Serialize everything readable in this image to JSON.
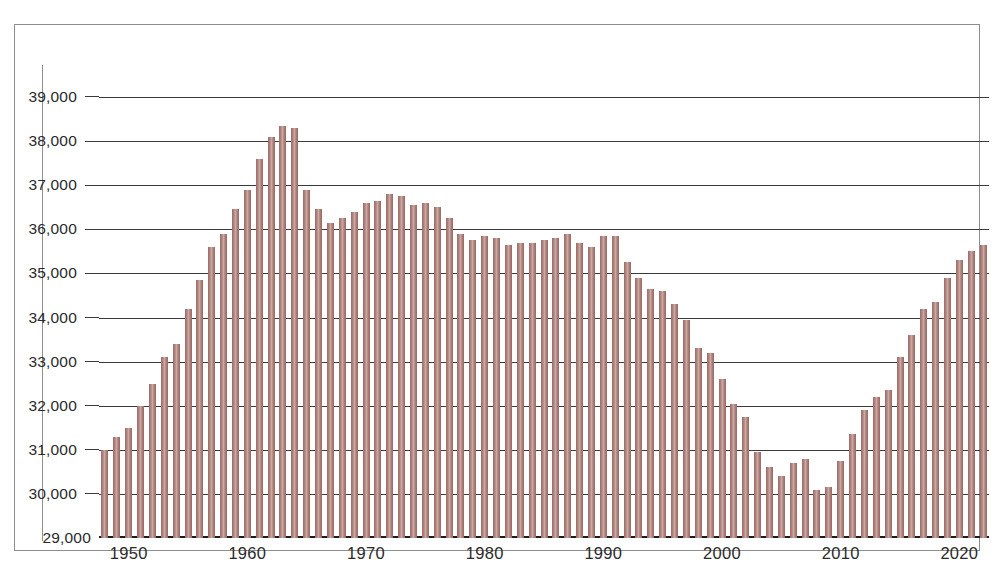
{
  "chart_data": {
    "type": "bar",
    "title": "",
    "subtitle": "",
    "xlabel": "",
    "ylabel": "",
    "ylim": [
      29000,
      39000
    ],
    "ytick_values": [
      29000,
      30000,
      31000,
      32000,
      33000,
      34000,
      35000,
      36000,
      37000,
      38000,
      39000
    ],
    "ytick_labels": [
      "29,000",
      "30,000",
      "31,000",
      "32,000",
      "33,000",
      "34,000",
      "35,000",
      "36,000",
      "37,000",
      "38,000",
      "39,000"
    ],
    "xtick_values": [
      1950,
      1960,
      1970,
      1980,
      1990,
      2000,
      2010,
      2020
    ],
    "xtick_labels": [
      "1950",
      "1960",
      "1970",
      "1980",
      "1990",
      "2000",
      "2010",
      "2020"
    ],
    "grid": true,
    "legend": "none",
    "bar_color": "#b08580",
    "bar_edge_color": "#9f6a63",
    "axis_color": "#3a3a3a",
    "frame_color": "#8d8d8d",
    "background_color": "#ffffff",
    "categories": [
      1948,
      1949,
      1950,
      1951,
      1952,
      1953,
      1954,
      1955,
      1956,
      1957,
      1958,
      1959,
      1960,
      1961,
      1962,
      1963,
      1964,
      1965,
      1966,
      1967,
      1968,
      1969,
      1970,
      1971,
      1972,
      1973,
      1974,
      1975,
      1976,
      1977,
      1978,
      1979,
      1980,
      1981,
      1982,
      1983,
      1984,
      1985,
      1986,
      1987,
      1988,
      1989,
      1990,
      1991,
      1992,
      1993,
      1994,
      1995,
      1996,
      1997,
      1998,
      1999,
      2000,
      2001,
      2002,
      2003,
      2004,
      2005,
      2006,
      2007,
      2008,
      2009,
      2010,
      2011,
      2012,
      2013,
      2014,
      2015,
      2016,
      2017,
      2018,
      2019,
      2020,
      2021,
      2022
    ],
    "values": [
      31000,
      31300,
      31500,
      32000,
      32500,
      33100,
      33400,
      34200,
      34850,
      35600,
      35900,
      36450,
      36900,
      37600,
      38100,
      38350,
      38300,
      36900,
      36450,
      36150,
      36250,
      36400,
      36600,
      36650,
      36800,
      36750,
      36550,
      36600,
      36500,
      36250,
      35900,
      35750,
      35850,
      35800,
      35650,
      35700,
      35700,
      35750,
      35800,
      35900,
      35700,
      35600,
      35850,
      35850,
      35250,
      34900,
      34650,
      34600,
      34300,
      33950,
      33300,
      33200,
      32600,
      32050,
      31750,
      30950,
      30600,
      30400,
      30700,
      30800,
      30100,
      30150,
      30750,
      31350,
      31900,
      32200,
      32350,
      33100,
      33600,
      34200,
      34350,
      34900,
      35300,
      35500,
      35650
    ]
  }
}
